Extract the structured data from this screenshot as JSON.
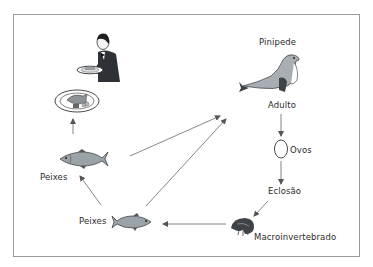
{
  "diagram": {
    "type": "food-web / life-cycle",
    "nodes": [
      {
        "id": "waiter",
        "label": "",
        "icon": "waiter-serving-dish-icon"
      },
      {
        "id": "plate",
        "label": "",
        "icon": "fish-dish-plate-icon"
      },
      {
        "id": "peixes_top",
        "label": "Peixes",
        "icon": "fish-icon"
      },
      {
        "id": "peixes_bottom",
        "label": "Peixes",
        "icon": "fish-icon"
      },
      {
        "id": "pinipede",
        "label": "Pinipede",
        "icon": "seal-icon"
      },
      {
        "id": "adulto",
        "label": "Adulto"
      },
      {
        "id": "ovos",
        "label": "Ovos",
        "icon": "egg-icon"
      },
      {
        "id": "eclosao",
        "label": "Eclosão"
      },
      {
        "id": "macro",
        "label": "Macroinvertebrado",
        "icon": "macroinvertebrate-icon"
      }
    ],
    "edges": [
      {
        "from": "peixes_top",
        "to": "plate"
      },
      {
        "from": "peixes_bottom",
        "to": "peixes_top"
      },
      {
        "from": "peixes_top",
        "to": "pinipede"
      },
      {
        "from": "peixes_bottom",
        "to": "pinipede"
      },
      {
        "from": "adulto",
        "to": "ovos"
      },
      {
        "from": "ovos",
        "to": "eclosao"
      },
      {
        "from": "eclosao",
        "to": "macro"
      },
      {
        "from": "macro",
        "to": "peixes_bottom"
      }
    ]
  },
  "labels": {
    "pinipede": "Pinipede",
    "adulto": "Adulto",
    "ovos": "Ovos",
    "eclosao": "Eclosão",
    "macro": "Macroinvertebrado",
    "peixes_top": "Peixes",
    "peixes_bottom": "Peixes"
  },
  "colors": {
    "frame": "#9a9a9a",
    "arrow": "#555555",
    "fish_body": "#9aa3a8",
    "seal_body": "#a8aeb3",
    "seal_flipper": "#3f4347",
    "waiter_suit": "#2e3135",
    "text": "#2b2b2b"
  }
}
